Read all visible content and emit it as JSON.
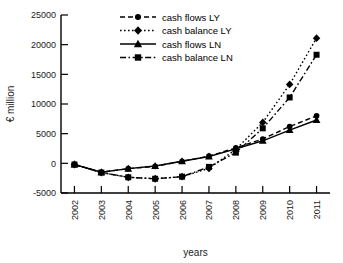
{
  "chart_data": {
    "type": "line",
    "title": "",
    "xlabel": "years",
    "ylabel": "€  million",
    "x": [
      2002,
      2003,
      2004,
      2005,
      2006,
      2007,
      2008,
      2009,
      2010,
      2011
    ],
    "categories": [
      "2002",
      "2003",
      "2004",
      "2005",
      "2006",
      "2007",
      "2008",
      "2009",
      "2010",
      "2011"
    ],
    "xlim": [
      2001.5,
      2011.5
    ],
    "ylim": [
      -5000,
      25000
    ],
    "ytick_labels": [
      "25000",
      "20000",
      "15000",
      "10000",
      "5000",
      "0",
      "-5000"
    ],
    "yticks": [
      25000,
      20000,
      15000,
      10000,
      5000,
      0,
      -5000
    ],
    "grid": false,
    "legend_position": "top-center",
    "series": [
      {
        "name": "cash flows LY",
        "marker": "circle",
        "dash": "dashed",
        "color": "#000000",
        "values": [
          -200,
          -1500,
          -900,
          -500,
          350,
          1200,
          2600,
          4100,
          6200,
          8000
        ]
      },
      {
        "name": "cash balance LY",
        "marker": "diamond",
        "dash": "dotted",
        "color": "#000000",
        "values": [
          -200,
          -1550,
          -2350,
          -2600,
          -2250,
          -850,
          2350,
          6900,
          13300,
          21100
        ]
      },
      {
        "name": "cash flows LN",
        "marker": "triangle",
        "dash": "solid",
        "color": "#000000",
        "values": [
          -200,
          -1500,
          -900,
          -450,
          350,
          1150,
          2450,
          3800,
          5600,
          7300
        ]
      },
      {
        "name": "cash balance LN",
        "marker": "square",
        "dash": "dashdot",
        "color": "#000000",
        "values": [
          -200,
          -1550,
          -2350,
          -2600,
          -2250,
          -600,
          1800,
          5900,
          11100,
          18300
        ]
      }
    ]
  }
}
